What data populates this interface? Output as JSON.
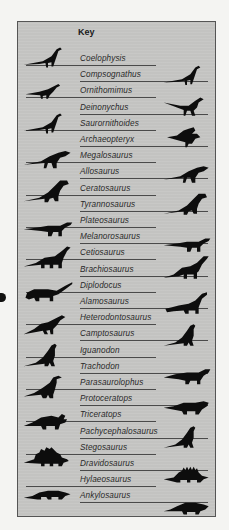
{
  "key": {
    "title": "Key",
    "entries": [
      {
        "name": "Coelophysis",
        "side": "left"
      },
      {
        "name": "Compsognathus",
        "side": "right"
      },
      {
        "name": "Ornithomimus",
        "side": "left"
      },
      {
        "name": "Deinonychus",
        "side": "right"
      },
      {
        "name": "Saurornithoides",
        "side": "left"
      },
      {
        "name": "Archaeopteryx",
        "side": "right"
      },
      {
        "name": "Megalosaurus",
        "side": "left"
      },
      {
        "name": "Allosaurus",
        "side": "right"
      },
      {
        "name": "Ceratosaurus",
        "side": "left"
      },
      {
        "name": "Tyrannosaurus",
        "side": "right"
      },
      {
        "name": "Plateosaurus",
        "side": "left"
      },
      {
        "name": "Melanorosaurus",
        "side": "right"
      },
      {
        "name": "Cetiosaurus",
        "side": "left"
      },
      {
        "name": "Brachiosaurus",
        "side": "right"
      },
      {
        "name": "Diplodocus",
        "side": "left"
      },
      {
        "name": "Alamosaurus",
        "side": "right"
      },
      {
        "name": "Heterodontosaurus",
        "side": "left"
      },
      {
        "name": "Camptosaurus",
        "side": "right"
      },
      {
        "name": "Iguanodon",
        "side": "left"
      },
      {
        "name": "Trachodon",
        "side": "right"
      },
      {
        "name": "Parasaurolophus",
        "side": "left"
      },
      {
        "name": "Protoceratops",
        "side": "right"
      },
      {
        "name": "Triceratops",
        "side": "left"
      },
      {
        "name": "Pachycephalosaurus",
        "side": "right"
      },
      {
        "name": "Stegosaurus",
        "side": "left"
      },
      {
        "name": "Dravidosaurus",
        "side": "right"
      },
      {
        "name": "Hylaeosaurus",
        "side": "left"
      },
      {
        "name": "Ankylosaurus",
        "side": "right"
      }
    ]
  },
  "silhouettes": {
    "left": [
      {
        "icon": "coelophysis-silhouette-icon",
        "shape": "theropod-small",
        "y": 22
      },
      {
        "icon": "ornithomimus-silhouette-icon",
        "shape": "theropod-tiny",
        "y": 55
      },
      {
        "icon": "saurornithoides-silhouette-icon",
        "shape": "theropod-small",
        "y": 88
      },
      {
        "icon": "megalosaurus-silhouette-icon",
        "shape": "theropod-mid",
        "y": 122
      },
      {
        "icon": "ceratosaurus-silhouette-icon",
        "shape": "theropod-large",
        "y": 155
      },
      {
        "icon": "plateosaurus-silhouette-icon",
        "shape": "prosauropod",
        "y": 190
      },
      {
        "icon": "cetiosaurus-silhouette-icon",
        "shape": "sauropod-low",
        "y": 222
      },
      {
        "icon": "diplodocus-silhouette-icon",
        "shape": "sauropod-long",
        "y": 255
      },
      {
        "icon": "heterodontosaurus-silhouette-icon",
        "shape": "ornithopod-small",
        "y": 288
      },
      {
        "icon": "iguanodon-silhouette-icon",
        "shape": "ornithopod-upright",
        "y": 320
      },
      {
        "icon": "parasaurolophus-silhouette-icon",
        "shape": "hadrosaur-crest",
        "y": 352
      },
      {
        "icon": "triceratops-silhouette-icon",
        "shape": "ceratopsian",
        "y": 385
      },
      {
        "icon": "stegosaurus-silhouette-icon",
        "shape": "stegosaur",
        "y": 420
      },
      {
        "icon": "hylaeosaurus-silhouette-icon",
        "shape": "ankylosaur-flat",
        "y": 455
      }
    ],
    "right": [
      {
        "icon": "compsognathus-silhouette-icon",
        "shape": "theropod-small",
        "y": 40
      },
      {
        "icon": "deinonychus-silhouette-icon",
        "shape": "theropod-raptor",
        "y": 70
      },
      {
        "icon": "archaeopteryx-silhouette-icon",
        "shape": "bird",
        "y": 103
      },
      {
        "icon": "allosaurus-silhouette-icon",
        "shape": "theropod-mid",
        "y": 137
      },
      {
        "icon": "tyrannosaurus-silhouette-icon",
        "shape": "theropod-large",
        "y": 168
      },
      {
        "icon": "melanorosaurus-silhouette-icon",
        "shape": "prosauropod",
        "y": 206
      },
      {
        "icon": "brachiosaurus-silhouette-icon",
        "shape": "sauropod-tall",
        "y": 232
      },
      {
        "icon": "alamosaurus-silhouette-icon",
        "shape": "sauropod-tall-curl",
        "y": 268
      },
      {
        "icon": "camptosaurus-silhouette-icon",
        "shape": "ornithopod-upright",
        "y": 300
      },
      {
        "icon": "trachodon-silhouette-icon",
        "shape": "hadrosaur-low",
        "y": 340
      },
      {
        "icon": "protoceratops-silhouette-icon",
        "shape": "ceratopsian-small",
        "y": 372
      },
      {
        "icon": "pachycephalosaurus-silhouette-icon",
        "shape": "ornithopod-upright",
        "y": 402
      },
      {
        "icon": "dravidosaurus-silhouette-icon",
        "shape": "stegosaur-low",
        "y": 440
      },
      {
        "icon": "ankylosaurus-silhouette-icon",
        "shape": "ankylosaur",
        "y": 472
      }
    ]
  },
  "colors": {
    "panel": "#c3c3c1",
    "border": "#555555",
    "rule": "#4a4a4a",
    "silhouette": "#0d0d0d",
    "text": "#2a2a2a"
  }
}
